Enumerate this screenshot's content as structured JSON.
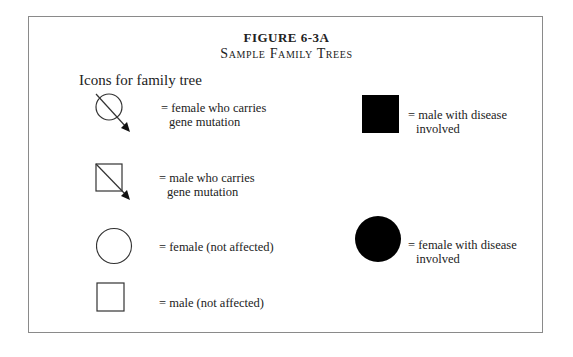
{
  "figure": {
    "number": "FIGURE 6-3A",
    "title": "Sample Family Trees",
    "subheading": "Icons for family tree"
  },
  "legend": {
    "female_carrier": {
      "icon": "circle-with-arrow-icon",
      "line1": "= female who carries",
      "line2": "gene mutation"
    },
    "male_carrier": {
      "icon": "square-with-arrow-icon",
      "line1": "= male who carries",
      "line2": "gene mutation"
    },
    "female_unaffected": {
      "icon": "open-circle-icon",
      "line1": "= female (not affected)"
    },
    "male_unaffected": {
      "icon": "open-square-icon",
      "line1": "= male (not affected)"
    },
    "male_affected": {
      "icon": "filled-square-icon",
      "line1": "= male with disease",
      "line2": "involved"
    },
    "female_affected": {
      "icon": "filled-circle-icon",
      "line1": "= female with disease",
      "line2": "involved"
    }
  },
  "colors": {
    "stroke": "#333333",
    "fill_affected": "#000000",
    "border": "#8a8a8a"
  }
}
